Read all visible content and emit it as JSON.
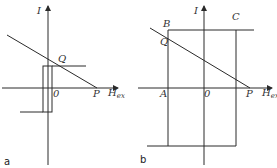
{
  "figure": {
    "panels": [
      {
        "id": "a",
        "panel_label": "a",
        "axis_y_label": "I",
        "axis_x_label": "H",
        "axis_x_subscript": "ex",
        "origin_label": "0",
        "points": {
          "Q": "Q",
          "P": "P"
        }
      },
      {
        "id": "b",
        "panel_label": "b",
        "axis_y_label": "I",
        "axis_x_label": "H",
        "axis_x_subscript": "ex",
        "origin_label": "0",
        "points": {
          "A": "A",
          "B": "B",
          "C": "C",
          "Q": "Q",
          "P": "P"
        }
      }
    ],
    "colors": {
      "line": "#2a2a2a",
      "text": "#333333",
      "background": "#ffffff"
    }
  }
}
